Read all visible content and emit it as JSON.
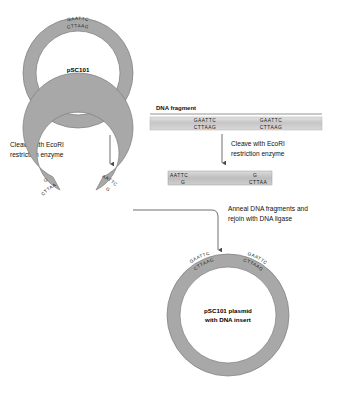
{
  "diagram": {
    "colors": {
      "ring_fill": "#a8a8a8",
      "ring_stroke": "#6f6f6f",
      "bar_fill": "#c9c9c9",
      "background": "#ffffff",
      "line": "#4a4a4a",
      "text": "#111111"
    }
  },
  "plasmid_top": {
    "center_line1": "pSC101",
    "center_line2": "plasmid",
    "site_top": "GAATTC",
    "site_bottom": "CTTAAG"
  },
  "step_cleave_plasmid": {
    "line1": "Cleave with EcoRI",
    "line2": "restriction enzyme"
  },
  "dna_fragment": {
    "label": "DNA fragment",
    "site_left_top": "GAATTC",
    "site_left_bottom": "CTTAAG",
    "site_right_top": "GAATTC",
    "site_right_bottom": "CTTAAG"
  },
  "step_cleave_fragment": {
    "line1": "Cleave with EcoRI",
    "line2": "restriction enzyme"
  },
  "cut_fragment": {
    "left_top": "AATTC",
    "left_bottom": "G",
    "right_top": "G",
    "right_bottom": "CTTAA"
  },
  "cut_plasmid": {
    "left_arm_top": "G",
    "left_arm_bottom": "CTTAA",
    "right_arm_top": "AATTC",
    "right_arm_bottom": "G"
  },
  "step_anneal": {
    "line1": "Anneal DNA fragments and",
    "line2": "rejoin with DNA ligase"
  },
  "plasmid_bottom": {
    "center_line1": "pSC101 plasmid",
    "center_line2": "with DNA insert",
    "site_left_top": "GAATTC",
    "site_left_bottom": "CTTAAG",
    "site_right_top": "GAATTC",
    "site_right_bottom": "CTTAAG"
  }
}
